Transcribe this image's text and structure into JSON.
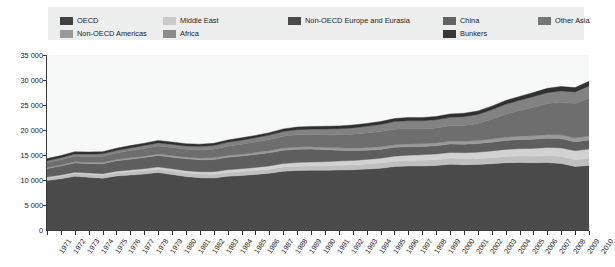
{
  "legend": {
    "background": "#eceded",
    "items": [
      {
        "label": "OECD",
        "color": "#404040",
        "col": 0,
        "row": 0
      },
      {
        "label": "Non-OECD Americas",
        "color": "#9a9a9a",
        "col": 0,
        "row": 1
      },
      {
        "label": "Middle East",
        "color": "#c9c9c9",
        "col": 1,
        "row": 0
      },
      {
        "label": "Africa",
        "color": "#8c8c8c",
        "col": 1,
        "row": 1
      },
      {
        "label": "Non-OECD Europe and Eurasia",
        "color": "#4a4a4a",
        "col": 2,
        "row": 0
      },
      {
        "label": "China",
        "color": "#636363",
        "col": 3,
        "row": 0
      },
      {
        "label": "Bunkers",
        "color": "#383838",
        "col": 3,
        "row": 1
      },
      {
        "label": "Other Asia",
        "color": "#767676",
        "col": 4,
        "row": 0
      }
    ]
  },
  "axes": {
    "y_ticks": [
      "0",
      "5 000",
      "10 000",
      "15 000",
      "20 000",
      "25 000",
      "30 000",
      "35 000"
    ],
    "y_min": 0,
    "y_max": 35000,
    "y_step": 5000,
    "x_labels": [
      "1971",
      "1972",
      "1973",
      "1974",
      "1975",
      "1976",
      "1977",
      "1978",
      "1979",
      "1980",
      "1981",
      "1982",
      "1983",
      "1984",
      "1985",
      "1986",
      "1987",
      "1988",
      "1989",
      "1990",
      "1991",
      "1992",
      "1993",
      "1994",
      "1995",
      "1996",
      "1997",
      "1998",
      "1999",
      "2000",
      "2001",
      "2002",
      "2003",
      "2004",
      "2005",
      "2006",
      "2007",
      "2008",
      "2009",
      "2010"
    ]
  },
  "chart_data": {
    "type": "area",
    "title": "",
    "xlabel": "",
    "ylabel": "",
    "ylim": [
      0,
      35000
    ],
    "grid": false,
    "legend_position": "top",
    "stacked": true,
    "x": [
      1971,
      1972,
      1973,
      1974,
      1975,
      1976,
      1977,
      1978,
      1979,
      1980,
      1981,
      1982,
      1983,
      1984,
      1985,
      1986,
      1987,
      1988,
      1989,
      1990,
      1991,
      1992,
      1993,
      1994,
      1995,
      1996,
      1997,
      1998,
      1999,
      2000,
      2001,
      2002,
      2003,
      2004,
      2005,
      2006,
      2007,
      2008,
      2009,
      2010
    ],
    "series": [
      {
        "name": "OECD",
        "color": "#4a4a4a",
        "values": [
          9900,
          10250,
          10750,
          10550,
          10350,
          10800,
          11000,
          11200,
          11500,
          11100,
          10700,
          10450,
          10400,
          10750,
          10900,
          11100,
          11350,
          11750,
          11900,
          11950,
          11950,
          12000,
          12050,
          12200,
          12350,
          12700,
          12800,
          12800,
          12900,
          13150,
          13050,
          13100,
          13250,
          13450,
          13500,
          13450,
          13500,
          13300,
          12700,
          12900
        ]
      },
      {
        "name": "Non-OECD Americas",
        "color": "#bfbfbf",
        "values": [
          520,
          550,
          580,
          600,
          620,
          650,
          670,
          700,
          720,
          730,
          740,
          740,
          740,
          760,
          780,
          800,
          820,
          850,
          870,
          890,
          910,
          940,
          960,
          1000,
          1030,
          1070,
          1110,
          1140,
          1160,
          1180,
          1180,
          1190,
          1210,
          1260,
          1300,
          1330,
          1380,
          1420,
          1400,
          1460
        ]
      },
      {
        "name": "Middle East",
        "color": "#d2d2d2",
        "values": [
          180,
          200,
          220,
          240,
          270,
          300,
          330,
          360,
          390,
          400,
          420,
          450,
          490,
          530,
          570,
          610,
          640,
          680,
          720,
          760,
          800,
          840,
          880,
          920,
          960,
          1000,
          1040,
          1090,
          1130,
          1170,
          1220,
          1280,
          1340,
          1400,
          1470,
          1540,
          1620,
          1700,
          1760,
          1830
        ]
      },
      {
        "name": "Non-OECD Europe and Eurasia",
        "color": "#5e5e5e",
        "values": [
          1700,
          1780,
          1860,
          1930,
          2010,
          2080,
          2150,
          2220,
          2290,
          2330,
          2370,
          2410,
          2450,
          2500,
          2540,
          2590,
          2640,
          2680,
          2650,
          2580,
          2400,
          2180,
          2000,
          1850,
          1780,
          1760,
          1700,
          1670,
          1660,
          1680,
          1700,
          1710,
          1760,
          1790,
          1800,
          1840,
          1850,
          1860,
          1760,
          1830
        ]
      },
      {
        "name": "Africa",
        "color": "#9a9a9a",
        "values": [
          200,
          210,
          225,
          235,
          250,
          265,
          280,
          295,
          310,
          320,
          330,
          345,
          355,
          370,
          385,
          400,
          410,
          425,
          440,
          455,
          465,
          475,
          485,
          495,
          510,
          525,
          540,
          555,
          565,
          580,
          595,
          610,
          630,
          655,
          680,
          700,
          725,
          750,
          765,
          790
        ]
      },
      {
        "name": "China",
        "color": "#6e6e6e",
        "values": [
          980,
          1050,
          1120,
          1160,
          1260,
          1320,
          1450,
          1550,
          1600,
          1600,
          1580,
          1650,
          1730,
          1860,
          2000,
          2100,
          2230,
          2380,
          2460,
          2470,
          2540,
          2620,
          2780,
          2930,
          3050,
          3120,
          3100,
          3020,
          3010,
          3080,
          3180,
          3420,
          3980,
          4620,
          5150,
          5700,
          6200,
          6500,
          6900,
          7550
        ]
      },
      {
        "name": "Other Asia",
        "color": "#828282",
        "values": [
          380,
          400,
          430,
          450,
          470,
          500,
          530,
          560,
          600,
          620,
          650,
          680,
          720,
          760,
          800,
          840,
          890,
          950,
          1010,
          1070,
          1130,
          1200,
          1270,
          1340,
          1420,
          1500,
          1570,
          1560,
          1620,
          1690,
          1740,
          1800,
          1880,
          1960,
          2030,
          2110,
          2200,
          2280,
          2330,
          2450
        ]
      },
      {
        "name": "Bunkers",
        "color": "#303030",
        "values": [
          420,
          440,
          460,
          450,
          440,
          460,
          470,
          480,
          500,
          490,
          470,
          450,
          450,
          460,
          470,
          480,
          490,
          510,
          530,
          545,
          550,
          560,
          570,
          585,
          600,
          620,
          640,
          650,
          665,
          685,
          690,
          700,
          720,
          760,
          790,
          820,
          860,
          890,
          870,
          920
        ]
      }
    ],
    "totals": [
      14280,
      14880,
      15645,
      15615,
      15670,
      16375,
      16880,
      17365,
      17910,
      17590,
      17220,
      17175,
      17335,
      17990,
      18445,
      18920,
      19470,
      20225,
      20580,
      20720,
      20745,
      20815,
      20995,
      21320,
      21700,
      22295,
      22500,
      22485,
      22710,
      23215,
      23355,
      23810,
      24770,
      25895,
      26720,
      27490,
      28335,
      28700,
      28485,
      29730
    ]
  }
}
